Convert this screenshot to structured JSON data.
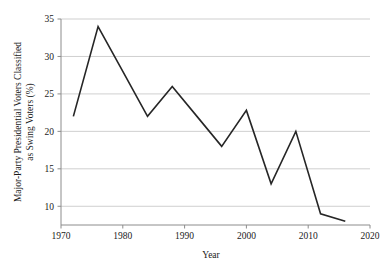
{
  "chart_data": {
    "type": "line",
    "title": "",
    "xlabel": "Year",
    "ylabel": "Major-Party Presidential Voters Classified as Swing Voters (%)",
    "ylabel_line1": "Major-Party Presidential Voters Classified",
    "ylabel_line2": "as Swing Voters (%)",
    "x": [
      1972,
      1976,
      1980,
      1984,
      1988,
      1992,
      1996,
      2000,
      2004,
      2008,
      2012,
      2016
    ],
    "values": [
      22,
      34,
      28,
      22,
      26,
      22,
      18,
      22.8,
      13,
      20,
      9,
      8
    ],
    "series": [
      {
        "name": "Swing voters",
        "x": [
          1972,
          1976,
          1980,
          1984,
          1988,
          1992,
          1996,
          2000,
          2004,
          2008,
          2012,
          2016
        ],
        "values": [
          22,
          34,
          28,
          22,
          26,
          22,
          18,
          22.8,
          13,
          20,
          9,
          8
        ]
      }
    ],
    "xlim": [
      1970,
      2020
    ],
    "ylim": [
      7.5,
      35
    ],
    "xticks": [
      1970,
      1980,
      1990,
      2000,
      2010,
      2020
    ],
    "xtick_labels": [
      "1970",
      "1980",
      "1990",
      "2000",
      "2010",
      "2020"
    ],
    "yticks": [
      10,
      15,
      20,
      25,
      30,
      35
    ],
    "ytick_labels": [
      "10",
      "15",
      "20",
      "25",
      "30",
      "35"
    ],
    "grid": "horizontal",
    "legend": "none",
    "line_color": "#262626",
    "grid_color": "#c9c9c9",
    "axis_color": "#8c8c8c",
    "background_color": "#ffffff"
  }
}
